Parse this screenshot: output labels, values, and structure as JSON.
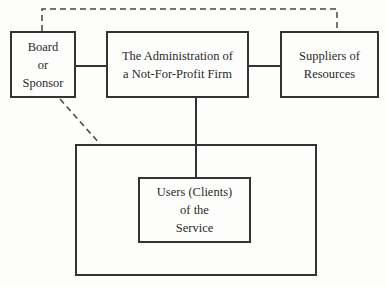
{
  "diagram": {
    "nodes": [
      {
        "id": "board",
        "label": "Board\nor\nSponsor"
      },
      {
        "id": "administration",
        "label": "The Administration of\na Not-For-Profit Firm"
      },
      {
        "id": "suppliers",
        "label": "Suppliers of\nResources"
      },
      {
        "id": "environment",
        "label": ""
      },
      {
        "id": "users",
        "label": "Users (Clients)\nof the\nService"
      }
    ],
    "edges": [
      {
        "from": "board",
        "to": "administration",
        "style": "solid"
      },
      {
        "from": "administration",
        "to": "suppliers",
        "style": "solid"
      },
      {
        "from": "administration",
        "to": "users",
        "style": "solid"
      },
      {
        "from": "board",
        "to": "suppliers",
        "style": "dashed"
      },
      {
        "from": "board",
        "to": "environment",
        "style": "dashed"
      }
    ]
  }
}
